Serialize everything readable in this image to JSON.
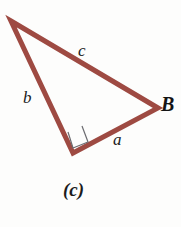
{
  "figure": {
    "caption": "(c)",
    "type": "right-triangle-diagram",
    "background_color": "#fdfdfc",
    "stroke_color": "#9e4a42",
    "stroke_width": 5,
    "right_angle_marker_color": "#6b6b70",
    "label_color": "#1b1b1b"
  },
  "labels": {
    "side_a": "a",
    "side_b": "b",
    "side_c": "c",
    "vertex_B": "B"
  },
  "geometry": {
    "vertices": {
      "top_left": {
        "x": 11,
        "y": 21
      },
      "right_B": {
        "x": 158,
        "y": 108
      },
      "bottom": {
        "x": 73,
        "y": 153
      }
    },
    "sides": [
      {
        "name": "c",
        "from": "top_left",
        "to": "right_B"
      },
      {
        "name": "b",
        "from": "top_left",
        "to": "bottom"
      },
      {
        "name": "a",
        "from": "bottom",
        "to": "right_B"
      }
    ],
    "right_angle_at": "bottom",
    "right_angle_marker": "68,132 73,148 88,142 82,126",
    "triangle_points": "11,21 158,108 73,153"
  }
}
